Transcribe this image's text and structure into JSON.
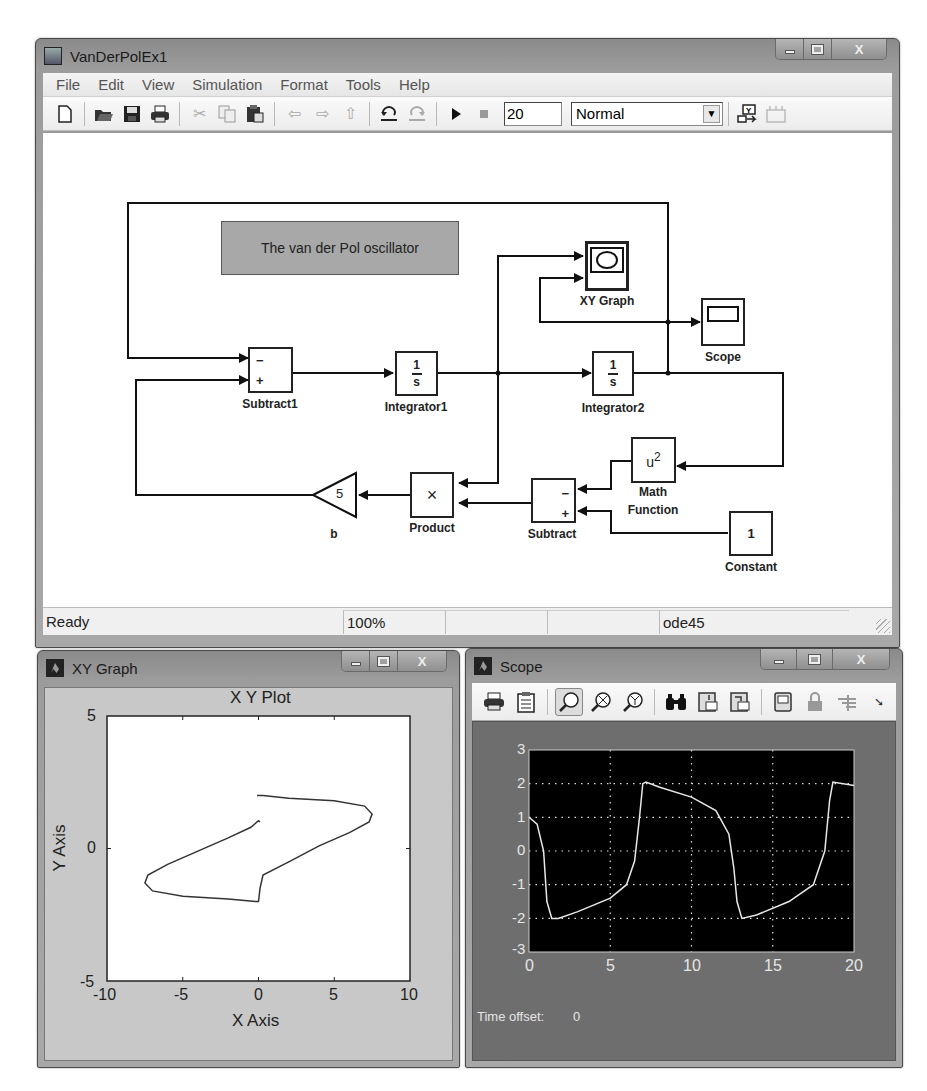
{
  "main_window": {
    "title": "VanDerPolEx1",
    "menu": [
      "File",
      "Edit",
      "View",
      "Simulation",
      "Format",
      "Tools",
      "Help"
    ],
    "toolbar": {
      "buttons": [
        "new-icon",
        "open-icon",
        "save-icon",
        "print-icon",
        "cut-icon",
        "copy-icon",
        "paste-icon",
        "back-icon",
        "forward-icon",
        "up-icon",
        "undo-icon",
        "redo-icon",
        "start-icon",
        "stop-icon"
      ],
      "stop_time": "20",
      "sim_mode": "Normal",
      "extra_buttons": [
        "build-icon",
        "library-icon"
      ]
    },
    "status": {
      "state": "Ready",
      "zoom": "100%",
      "cell3": "",
      "cell4": "",
      "solver": "ode45"
    }
  },
  "diagram": {
    "annotation": "The van der Pol oscillator",
    "blocks": {
      "subtract1": {
        "label": "Subtract1",
        "port_minus": "−",
        "port_plus": "+"
      },
      "integrator1": {
        "label": "Integrator1",
        "num": "1",
        "den": "s"
      },
      "integrator2": {
        "label": "Integrator2",
        "num": "1",
        "den": "s"
      },
      "xy_graph": {
        "label": "XY Graph"
      },
      "scope": {
        "label": "Scope"
      },
      "math_function": {
        "label_line1": "Math",
        "label_line2": "Function",
        "expr": "u",
        "exp": "2"
      },
      "constant": {
        "label": "Constant",
        "value": "1"
      },
      "subtract": {
        "label": "Subtract",
        "port_minus": "−",
        "port_plus": "+"
      },
      "product": {
        "label": "Product",
        "symbol": "×"
      },
      "gain": {
        "label": "b",
        "value": "5"
      }
    }
  },
  "xy_window": {
    "title": "XY Graph"
  },
  "scope_window": {
    "title": "Scope",
    "toolbar": [
      "print-icon",
      "parameters-icon",
      "zoom-icon",
      "zoom-x-icon",
      "zoom-y-icon",
      "autoscale-icon",
      "save-axes-icon",
      "restore-axes-icon",
      "floating-scope-icon",
      "lock-axes-icon",
      "signal-selector-icon",
      "dock-icon"
    ],
    "time_offset_label": "Time offset:",
    "time_offset_value": "0"
  },
  "chart_data": [
    {
      "type": "line",
      "title": "X Y Plot",
      "xlabel": "X Axis",
      "ylabel": "Y Axis",
      "xlim": [
        -10,
        10
      ],
      "ylim": [
        -5,
        5
      ],
      "xticks": [
        "-10",
        "-5",
        "0",
        "5",
        "10"
      ],
      "yticks": [
        "-5",
        "0",
        "5"
      ],
      "grid": false,
      "series": [
        {
          "name": "phase trajectory",
          "x": [
            0.1,
            0.0,
            -0.5,
            -2.0,
            -4.0,
            -6.0,
            -7.3,
            -7.5,
            -7.0,
            -5.0,
            -2.0,
            -0.2,
            0.0,
            0.1,
            0.3,
            2.0,
            4.0,
            6.0,
            7.3,
            7.5,
            7.0,
            5.0,
            2.0,
            0.3,
            -0.1
          ],
          "y": [
            1.0,
            1.05,
            0.8,
            0.4,
            -0.1,
            -0.6,
            -1.0,
            -1.3,
            -1.6,
            -1.8,
            -1.9,
            -2.0,
            -2.0,
            -1.5,
            -1.0,
            -0.5,
            0.1,
            0.6,
            1.0,
            1.3,
            1.6,
            1.8,
            1.9,
            2.0,
            2.0
          ]
        }
      ]
    },
    {
      "type": "line",
      "title": "",
      "xlabel": "",
      "ylabel": "",
      "xlim": [
        0,
        20
      ],
      "ylim": [
        -3,
        3
      ],
      "xticks": [
        "0",
        "5",
        "10",
        "15",
        "20"
      ],
      "yticks": [
        "3",
        "2",
        "1",
        "0",
        "-1",
        "-2",
        "-3"
      ],
      "grid": true,
      "series": [
        {
          "name": "x(t)",
          "x": [
            0,
            0.5,
            0.9,
            1.1,
            1.4,
            1.8,
            3,
            5,
            6,
            6.5,
            6.8,
            7.0,
            7.2,
            8,
            10,
            11.5,
            12.3,
            12.6,
            12.8,
            13.1,
            14,
            16,
            17.5,
            18.2,
            18.5,
            18.7,
            20
          ],
          "y": [
            1.0,
            0.8,
            0.0,
            -1.5,
            -2.0,
            -2.0,
            -1.8,
            -1.4,
            -1.0,
            -0.3,
            1.0,
            2.0,
            2.05,
            1.9,
            1.6,
            1.2,
            0.5,
            -0.5,
            -1.5,
            -2.0,
            -1.9,
            -1.5,
            -1.0,
            0.0,
            1.5,
            2.05,
            1.95
          ]
        }
      ]
    }
  ]
}
